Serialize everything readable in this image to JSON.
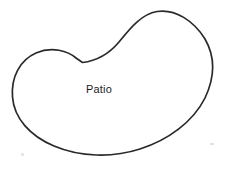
{
  "canvas": {
    "width": 227,
    "height": 169,
    "background_color": "#ffffff"
  },
  "diagram": {
    "type": "freeform-region-sketch",
    "title": "Patio",
    "shapes": [
      {
        "name": "patio-region",
        "kind": "closed-curve",
        "description": "kidney / bean shaped outline with concave notch at top-center-left and rounded lobe at upper right",
        "stroke_color": "#2a2a2a",
        "fill_color": "#ffffff",
        "stroke_width": 1.7,
        "path": "M 82.5 62.5 C 96 61 108 55 119 42 C 131 27 142 14 157 11.5 C 175 8.5 194 21 205 39 C 216 58 214 79 205 98 C 193 122 168 140 140 149 C 112 158 80 157 54 146 C 30 136 14 118 12.5 97 C 11 77 20 60 36 53 C 52 46 68 51 76 58 Z",
        "bounds": {
          "left": 12,
          "top": 11,
          "right": 213,
          "bottom": 153
        }
      }
    ],
    "labels": [
      {
        "name": "patio-label",
        "text": "Patio",
        "x": 86,
        "y": 84,
        "font_size": 11,
        "color": "#1c1c1c"
      }
    ],
    "artifacts": [
      {
        "name": "scan-speck-bottom-left",
        "x": 21,
        "y": 153,
        "style": "s1"
      },
      {
        "name": "scan-speck-right",
        "x": 210,
        "y": 143,
        "style": "s2"
      }
    ]
  }
}
